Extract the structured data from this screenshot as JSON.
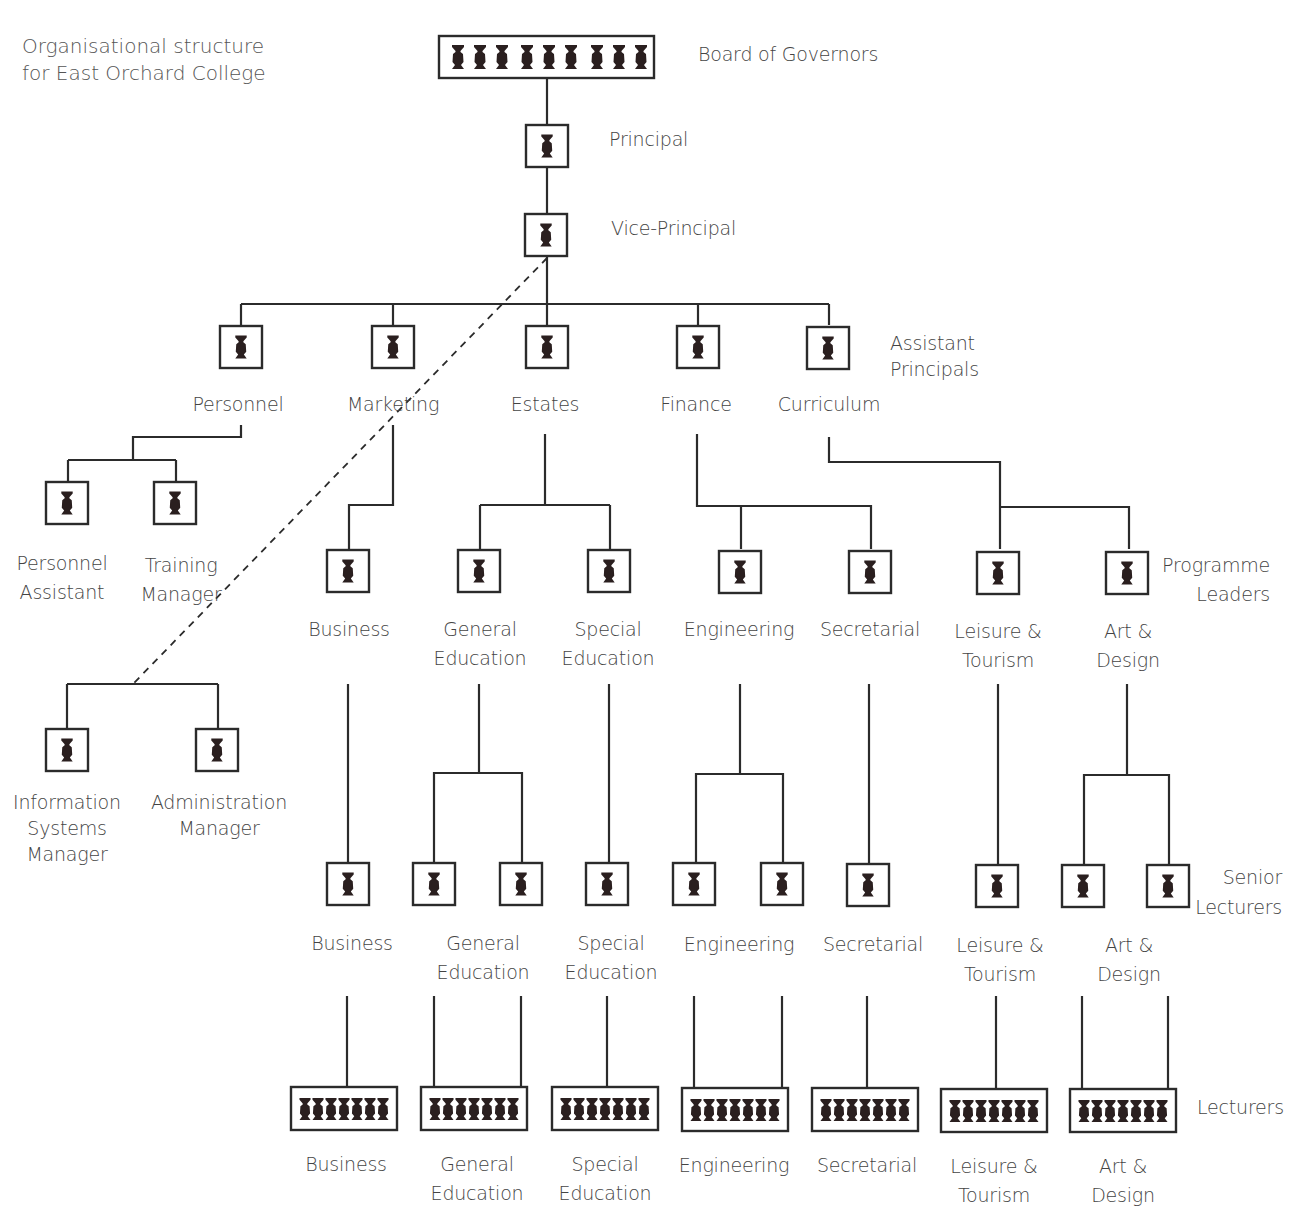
{
  "title": {
    "line1": "Organisational structure",
    "line2": "for East Orchard College"
  },
  "colors": {
    "line": "#2b2b2b",
    "figure": "#2a1f1f",
    "text": "#444444",
    "background": "#ffffff"
  },
  "levels": {
    "board": {
      "label": "Board of Governors",
      "members": 9
    },
    "principal": {
      "label": "Principal"
    },
    "vice_principal": {
      "label": "Vice-Principal"
    },
    "assistant_principals": {
      "label_line1": "Assistant",
      "label_line2": "Principals"
    },
    "programme_leaders": {
      "label_line1": "Programme",
      "label_line2": "Leaders"
    },
    "senior_lecturers": {
      "label_line1": "Senior",
      "label_line2": "Lecturers"
    },
    "lecturers": {
      "label": "Lecturers",
      "members_per_group": 7
    }
  },
  "assistant_principals": [
    {
      "name": "Personnel"
    },
    {
      "name": "Marketing"
    },
    {
      "name": "Estates"
    },
    {
      "name": "Finance"
    },
    {
      "name": "Curriculum"
    }
  ],
  "personnel_reports": [
    {
      "line1": "Personnel",
      "line2": "Assistant"
    },
    {
      "line1": "Training",
      "line2": "Manager"
    }
  ],
  "vice_principal_reports": [
    {
      "line1": "Information",
      "line2": "Systems",
      "line3": "Manager"
    },
    {
      "line1": "Administration",
      "line2": "Manager"
    }
  ],
  "programmes": [
    {
      "line1": "Business",
      "line2": "",
      "reports_to": "Marketing",
      "senior_lecturers": 1
    },
    {
      "line1": "General",
      "line2": "Education",
      "reports_to": "Estates",
      "senior_lecturers": 2
    },
    {
      "line1": "Special",
      "line2": "Education",
      "reports_to": "Estates",
      "senior_lecturers": 1
    },
    {
      "line1": "Engineering",
      "line2": "",
      "reports_to": "Finance",
      "senior_lecturers": 2
    },
    {
      "line1": "Secretarial",
      "line2": "",
      "reports_to": "Finance",
      "senior_lecturers": 1
    },
    {
      "line1": "Leisure &",
      "line2": "Tourism",
      "reports_to": "Curriculum",
      "senior_lecturers": 1
    },
    {
      "line1": "Art &",
      "line2": "Design",
      "reports_to": "Curriculum",
      "senior_lecturers": 2
    }
  ],
  "notes": {
    "dashed_link": "Dotted reporting line from Vice-Principal to Information Systems Manager / Administration Manager"
  }
}
